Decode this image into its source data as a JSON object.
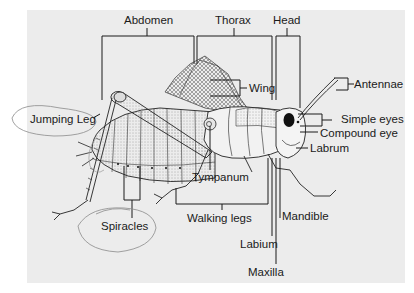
{
  "diagram": {
    "colors": {
      "background": "#ffffff",
      "panel": "#ececec",
      "ink": "#1a1a1a",
      "pencil_annotation": "#8a8a8a"
    },
    "body_regions": [
      {
        "id": "abdomen",
        "label": "Abdomen"
      },
      {
        "id": "thorax",
        "label": "Thorax"
      },
      {
        "id": "head",
        "label": "Head"
      }
    ],
    "parts": [
      {
        "id": "wing",
        "label": "Wing"
      },
      {
        "id": "antennae",
        "label": "Antennae"
      },
      {
        "id": "simple-eyes",
        "label": "Simple eyes"
      },
      {
        "id": "compound-eye",
        "label": "Compound eye"
      },
      {
        "id": "labrum",
        "label": "Labrum"
      },
      {
        "id": "jumping-leg",
        "label": "Jumping Leg"
      },
      {
        "id": "tympanum",
        "label": "Tympanum"
      },
      {
        "id": "spiracles",
        "label": "Spiracles"
      },
      {
        "id": "walking-legs",
        "label": "Walking legs"
      },
      {
        "id": "mandible",
        "label": "Mandible"
      },
      {
        "id": "labium",
        "label": "Labium"
      },
      {
        "id": "maxilla",
        "label": "Maxilla"
      }
    ],
    "hand_annotations": [
      {
        "id": "circle-jumping-leg",
        "target": "Jumping Leg"
      },
      {
        "id": "circle-spiracles",
        "target": "Spiracles"
      }
    ]
  }
}
